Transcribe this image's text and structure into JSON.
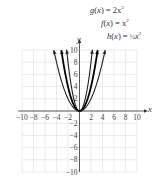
{
  "chart_data": {
    "type": "line",
    "title": "",
    "xlabel": "x",
    "ylabel": "y",
    "xlim": [
      -10,
      10
    ],
    "ylim": [
      -10,
      10
    ],
    "grid": true,
    "x_ticks": [
      -10,
      -8,
      -6,
      -4,
      -2,
      2,
      4,
      6,
      8,
      10
    ],
    "y_ticks": [
      -10,
      -8,
      -6,
      -4,
      -2,
      2,
      4,
      6,
      8,
      10
    ],
    "x_tick_labels": [
      "−10",
      "−8",
      "−6",
      "−4",
      "−2",
      "2",
      "4",
      "6",
      "8",
      "10"
    ],
    "y_tick_labels": [
      "−10",
      "−8",
      "−6",
      "−4",
      "−2",
      "2",
      "4",
      "6",
      "8",
      "10"
    ],
    "series": [
      {
        "name": "g(x) = 2x²",
        "formula": "2*x^2",
        "x_range": [
          -2.24,
          2.24
        ],
        "color": "#222222",
        "width": 1.1
      },
      {
        "name": "f(x) = x²",
        "formula": "x^2",
        "x_range": [
          -3.16,
          3.16
        ],
        "color": "#000000",
        "width": 1.8
      },
      {
        "name": "h(x) = ½x²",
        "formula": "0.5*x^2",
        "x_range": [
          -4.47,
          4.47
        ],
        "color": "#222222",
        "width": 1.1
      }
    ],
    "annotations": [
      {
        "text": "g(x) = 2x²",
        "position": "top-right"
      },
      {
        "text": "f(x) = x²",
        "position": "top-right"
      },
      {
        "text": "h(x) = ½x²",
        "position": "top-right"
      }
    ]
  },
  "labels": {
    "g": {
      "fn": "g",
      "arg": "x",
      "rhs": "= 2x",
      "exp": "2"
    },
    "f": {
      "fn": "f",
      "arg": "x",
      "rhs": "= x",
      "exp": "2"
    },
    "h": {
      "fn": "h",
      "arg": "x",
      "rhs": "= ",
      "frac": "½",
      "var": "x",
      "exp": "2"
    },
    "x_axis": "x",
    "y_axis": "y"
  }
}
